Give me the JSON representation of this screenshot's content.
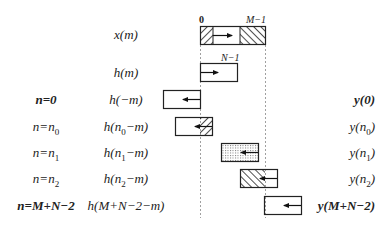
{
  "ticks": {
    "zero": "0",
    "m_minus_1": "M−1",
    "n_minus_1": "N−1"
  },
  "rows": [
    {
      "left": "",
      "mid": "x(m)",
      "right": ""
    },
    {
      "left": "",
      "mid": "h(m)",
      "right": ""
    },
    {
      "left": "n=0",
      "mid": "h(−m)",
      "right": "y(0)"
    },
    {
      "left": "n=n",
      "left_sub": "0",
      "mid_a": "h(n",
      "mid_sub": "0",
      "mid_b": "−m)",
      "right_a": "y(n",
      "right_sub": "0",
      "right_b": ")"
    },
    {
      "left": "n=n",
      "left_sub": "1",
      "mid_a": "h(n",
      "mid_sub": "1",
      "mid_b": "−m)",
      "right_a": "y(n",
      "right_sub": "1",
      "right_b": ")"
    },
    {
      "left": "n=n",
      "left_sub": "2",
      "mid_a": "h(n",
      "mid_sub": "2",
      "mid_b": "−m)",
      "right_a": "y(n",
      "right_sub": "2",
      "right_b": ")"
    },
    {
      "left": "n=M+N−2",
      "mid": "h(M+N−2−m)",
      "right": "y(M+N−2)"
    }
  ],
  "colors": {
    "stroke": "#222222",
    "dashed": "#888888",
    "dots": "#999999"
  }
}
